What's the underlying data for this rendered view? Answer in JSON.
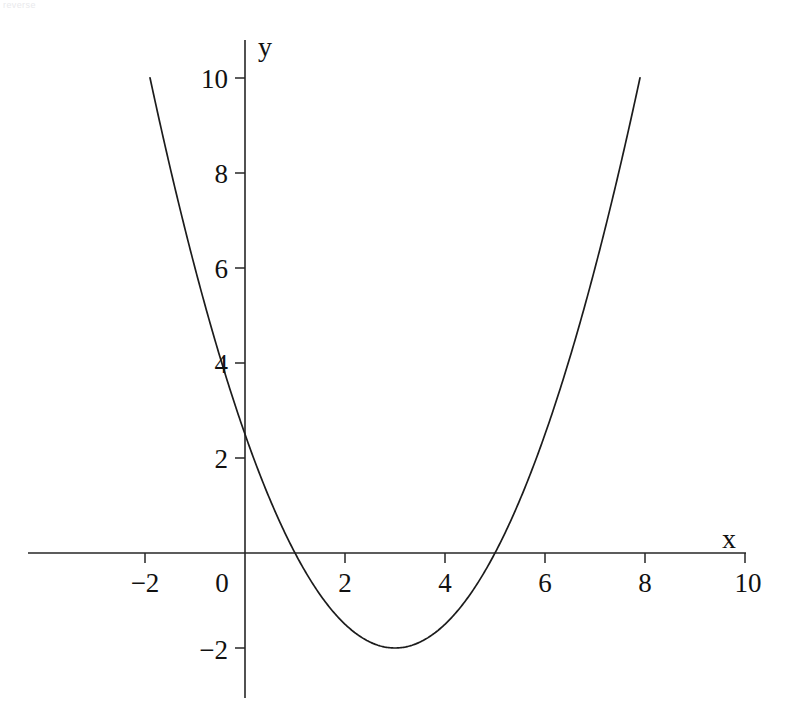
{
  "page": {
    "background_color": "#ffffff",
    "artifact_text": "reverse"
  },
  "chart_data": {
    "type": "line",
    "title": "",
    "subtitle": "",
    "xlabel": "x",
    "ylabel": "y",
    "grid": false,
    "legend": "none",
    "line_color": "#1c1c1c",
    "axis_color": "#262626",
    "xlim": [
      -3.2,
      10.5
    ],
    "ylim": [
      -3.0,
      10.8
    ],
    "xticks": [
      -2,
      0,
      2,
      4,
      6,
      8,
      10
    ],
    "xtick_labels": [
      "−2",
      "0",
      "2",
      "4",
      "6",
      "8",
      "10"
    ],
    "yticks": [
      -2,
      2,
      4,
      6,
      8,
      10
    ],
    "ytick_labels": [
      "−2",
      "2",
      "4",
      "6",
      "8",
      "10"
    ],
    "equation": "y = 0.5x² − 3x + 2.5",
    "coefficients": {
      "a": 0.5,
      "b": -3,
      "c": 2.5
    },
    "vertex": [
      3,
      -2
    ],
    "roots": [
      1,
      5
    ],
    "y_intercept": 2.5,
    "curve_domain": [
      -1.9,
      7.9
    ],
    "series": [
      {
        "name": "y = 0.5x² − 3x + 2.5",
        "x": [
          -1.9,
          -1.6,
          -1.2,
          -0.8,
          -0.4,
          0,
          0.4,
          0.8,
          1.2,
          1.6,
          2,
          2.4,
          2.8,
          3,
          3.2,
          3.6,
          4,
          4.4,
          4.8,
          5.2,
          5.6,
          6,
          6.4,
          6.8,
          7.2,
          7.6,
          7.9
        ],
        "y": [
          9.9,
          8.58,
          6.82,
          5.22,
          3.78,
          2.5,
          1.38,
          0.42,
          -0.38,
          -1.02,
          -1.5,
          -1.82,
          -1.98,
          -2,
          -1.98,
          -1.82,
          -1.5,
          -1.02,
          -0.38,
          0.42,
          1.38,
          2.5,
          3.78,
          5.22,
          6.82,
          8.58,
          9.92
        ]
      }
    ]
  },
  "axes": {
    "x_axis_title": "x",
    "y_axis_title": "y"
  }
}
